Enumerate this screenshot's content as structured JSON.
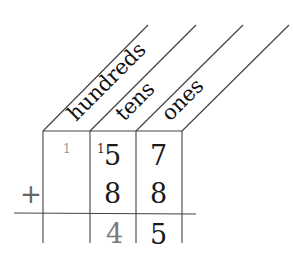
{
  "diagram": {
    "type": "place-value addition chart",
    "column_headers": [
      "hundreds",
      "tens",
      "ones"
    ],
    "carries": {
      "hundreds": "1",
      "tens": "1"
    },
    "rows": [
      {
        "operator": "",
        "hundreds": "",
        "tens": "5",
        "ones": "7"
      },
      {
        "operator": "+",
        "hundreds": "",
        "tens": "8",
        "ones": "8"
      }
    ],
    "result": {
      "hundreds": "",
      "tens": "4",
      "ones": "5"
    },
    "colors": {
      "line": "#444444",
      "text": "#1a1a1a",
      "faint": "#7a7a7a"
    }
  }
}
